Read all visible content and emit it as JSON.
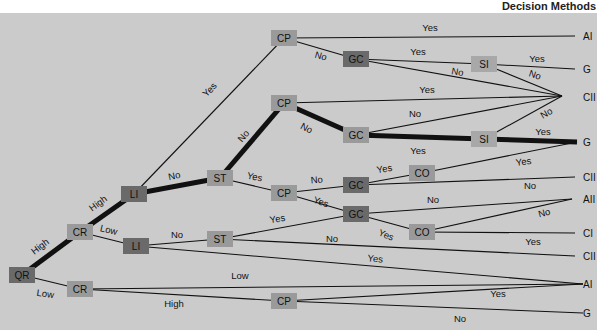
{
  "title": "Decision Methods",
  "colors": {
    "background": "#cbcbcb",
    "node_dark": "#6a6a6a",
    "node_medium": "#9a9a9a",
    "node_light": "#a8a8a8",
    "edge": "#111111"
  },
  "nodes": [
    {
      "id": "QR",
      "label": "QR",
      "x": 22,
      "y": 275,
      "shade": "dark"
    },
    {
      "id": "CR1",
      "label": "CR",
      "x": 80,
      "y": 232,
      "shade": "medium"
    },
    {
      "id": "CR2",
      "label": "CR",
      "x": 80,
      "y": 289,
      "shade": "medium"
    },
    {
      "id": "LI1",
      "label": "LI",
      "x": 134,
      "y": 194,
      "shade": "dark"
    },
    {
      "id": "LI2",
      "label": "LI",
      "x": 136,
      "y": 246,
      "shade": "dark"
    },
    {
      "id": "ST1",
      "label": "ST",
      "x": 220,
      "y": 178,
      "shade": "medium"
    },
    {
      "id": "ST2",
      "label": "ST",
      "x": 220,
      "y": 239,
      "shade": "medium"
    },
    {
      "id": "CP1",
      "label": "CP",
      "x": 284,
      "y": 38,
      "shade": "medium"
    },
    {
      "id": "CP2",
      "label": "CP",
      "x": 284,
      "y": 103,
      "shade": "medium"
    },
    {
      "id": "CP3",
      "label": "CP",
      "x": 284,
      "y": 193,
      "shade": "medium"
    },
    {
      "id": "CP4",
      "label": "CP",
      "x": 284,
      "y": 301,
      "shade": "medium"
    },
    {
      "id": "GC1",
      "label": "GC",
      "x": 356,
      "y": 59,
      "shade": "dark"
    },
    {
      "id": "GC2",
      "label": "GC",
      "x": 356,
      "y": 135,
      "shade": "medium"
    },
    {
      "id": "GC3",
      "label": "GC",
      "x": 356,
      "y": 185,
      "shade": "dark"
    },
    {
      "id": "GC4",
      "label": "GC",
      "x": 356,
      "y": 214,
      "shade": "dark"
    },
    {
      "id": "CO1",
      "label": "CO",
      "x": 422,
      "y": 173,
      "shade": "medium"
    },
    {
      "id": "CO2",
      "label": "CO",
      "x": 422,
      "y": 232,
      "shade": "medium"
    },
    {
      "id": "SI1",
      "label": "SI",
      "x": 484,
      "y": 64,
      "shade": "light"
    },
    {
      "id": "SI2",
      "label": "SI",
      "x": 484,
      "y": 139,
      "shade": "light"
    }
  ],
  "outcomes": [
    {
      "id": "o1",
      "label": "AI",
      "x": 583,
      "y": 36
    },
    {
      "id": "o2",
      "label": "G",
      "x": 583,
      "y": 69
    },
    {
      "id": "o3",
      "label": "CII",
      "x": 583,
      "y": 97
    },
    {
      "id": "o4",
      "label": "G",
      "x": 583,
      "y": 142
    },
    {
      "id": "o5",
      "label": "CII",
      "x": 583,
      "y": 177
    },
    {
      "id": "o6",
      "label": "AII",
      "x": 583,
      "y": 199
    },
    {
      "id": "o7",
      "label": "CI",
      "x": 583,
      "y": 233
    },
    {
      "id": "o8",
      "label": "CII",
      "x": 583,
      "y": 256
    },
    {
      "id": "o9",
      "label": "AI",
      "x": 583,
      "y": 284
    },
    {
      "id": "o10",
      "label": "G",
      "x": 583,
      "y": 313
    }
  ],
  "edges": [
    {
      "x1": 22,
      "y1": 275,
      "x2": 80,
      "y2": 232,
      "label": "High",
      "lx": 42,
      "ly": 249,
      "rot": -37,
      "thick": true
    },
    {
      "x1": 22,
      "y1": 275,
      "x2": 80,
      "y2": 289,
      "label": "Low",
      "lx": 45,
      "ly": 297,
      "rot": 8,
      "thick": false
    },
    {
      "x1": 80,
      "y1": 232,
      "x2": 134,
      "y2": 194,
      "label": "High",
      "lx": 100,
      "ly": 206,
      "rot": -36,
      "thick": true
    },
    {
      "x1": 80,
      "y1": 232,
      "x2": 136,
      "y2": 246,
      "label": "Low",
      "lx": 108,
      "ly": 233,
      "rot": 14,
      "thick": false
    },
    {
      "x1": 134,
      "y1": 194,
      "x2": 284,
      "y2": 38,
      "label": "Yes",
      "lx": 212,
      "ly": 92,
      "rot": -46,
      "thick": false
    },
    {
      "x1": 134,
      "y1": 194,
      "x2": 220,
      "y2": 178,
      "label": "No",
      "lx": 175,
      "ly": 179,
      "rot": -12,
      "thick": true
    },
    {
      "x1": 220,
      "y1": 178,
      "x2": 284,
      "y2": 103,
      "label": "No",
      "lx": 246,
      "ly": 138,
      "rot": -50,
      "thick": true
    },
    {
      "x1": 220,
      "y1": 178,
      "x2": 284,
      "y2": 193,
      "label": "Yes",
      "lx": 254,
      "ly": 180,
      "rot": 12,
      "thick": false
    },
    {
      "x1": 136,
      "y1": 246,
      "x2": 220,
      "y2": 239,
      "label": "No",
      "lx": 177,
      "ly": 238,
      "rot": 0,
      "thick": false
    },
    {
      "x1": 136,
      "y1": 246,
      "x2": 583,
      "y2": 284,
      "label": "Yes",
      "lx": 375,
      "ly": 262,
      "rot": 5,
      "thick": false
    },
    {
      "x1": 80,
      "y1": 289,
      "x2": 583,
      "y2": 284,
      "label": "Low",
      "lx": 240,
      "ly": 279,
      "rot": 0,
      "thick": false
    },
    {
      "x1": 80,
      "y1": 289,
      "x2": 284,
      "y2": 301,
      "label": "High",
      "lx": 174,
      "ly": 307,
      "rot": 0,
      "thick": false
    },
    {
      "x1": 284,
      "y1": 301,
      "x2": 583,
      "y2": 284,
      "label": "Yes",
      "lx": 498,
      "ly": 297,
      "rot": 0,
      "thick": false
    },
    {
      "x1": 284,
      "y1": 301,
      "x2": 583,
      "y2": 313,
      "label": "No",
      "lx": 460,
      "ly": 322,
      "rot": 0,
      "thick": false
    },
    {
      "x1": 284,
      "y1": 38,
      "x2": 575,
      "y2": 36,
      "label": "Yes",
      "lx": 430,
      "ly": 31,
      "rot": 0,
      "thick": false
    },
    {
      "x1": 284,
      "y1": 38,
      "x2": 356,
      "y2": 59,
      "label": "No",
      "lx": 320,
      "ly": 59,
      "rot": 15,
      "thick": false
    },
    {
      "x1": 356,
      "y1": 59,
      "x2": 484,
      "y2": 64,
      "label": "Yes",
      "lx": 418,
      "ly": 55,
      "rot": 0,
      "thick": false
    },
    {
      "x1": 356,
      "y1": 59,
      "x2": 562,
      "y2": 96,
      "label": "No",
      "lx": 457,
      "ly": 75,
      "rot": 10,
      "thick": false
    },
    {
      "x1": 484,
      "y1": 64,
      "x2": 575,
      "y2": 69,
      "label": "Yes",
      "lx": 537,
      "ly": 62,
      "rot": 0,
      "thick": false
    },
    {
      "x1": 484,
      "y1": 64,
      "x2": 562,
      "y2": 96,
      "label": "No",
      "lx": 534,
      "ly": 78,
      "rot": 18,
      "thick": false
    },
    {
      "x1": 284,
      "y1": 103,
      "x2": 562,
      "y2": 96,
      "label": "Yes",
      "lx": 427,
      "ly": 93,
      "rot": 0,
      "thick": false
    },
    {
      "x1": 284,
      "y1": 103,
      "x2": 356,
      "y2": 135,
      "label": "No",
      "lx": 305,
      "ly": 131,
      "rot": 28,
      "thick": true
    },
    {
      "x1": 356,
      "y1": 135,
      "x2": 562,
      "y2": 96,
      "label": "No",
      "lx": 415,
      "ly": 117,
      "rot": 0,
      "thick": false
    },
    {
      "x1": 356,
      "y1": 135,
      "x2": 484,
      "y2": 139,
      "label": "Yes",
      "lx": 418,
      "ly": 154,
      "rot": 0,
      "thick": true
    },
    {
      "x1": 484,
      "y1": 139,
      "x2": 562,
      "y2": 96,
      "label": "No",
      "lx": 548,
      "ly": 116,
      "rot": -30,
      "thick": false
    },
    {
      "x1": 484,
      "y1": 139,
      "x2": 577,
      "y2": 142,
      "label": "Yes",
      "lx": 543,
      "ly": 135,
      "rot": 0,
      "thick": true
    },
    {
      "x1": 284,
      "y1": 193,
      "x2": 356,
      "y2": 185,
      "label": "No",
      "lx": 317,
      "ly": 183,
      "rot": -5,
      "thick": false
    },
    {
      "x1": 284,
      "y1": 193,
      "x2": 356,
      "y2": 214,
      "label": "Yes",
      "lx": 320,
      "ly": 205,
      "rot": 18,
      "thick": false
    },
    {
      "x1": 356,
      "y1": 185,
      "x2": 422,
      "y2": 173,
      "label": "Yes",
      "lx": 385,
      "ly": 172,
      "rot": -10,
      "thick": false
    },
    {
      "x1": 356,
      "y1": 185,
      "x2": 575,
      "y2": 177,
      "label": "No",
      "lx": 530,
      "ly": 189,
      "rot": 0,
      "thick": false
    },
    {
      "x1": 422,
      "y1": 173,
      "x2": 577,
      "y2": 142,
      "label": "Yes",
      "lx": 524,
      "ly": 165,
      "rot": -8,
      "thick": false
    },
    {
      "x1": 220,
      "y1": 239,
      "x2": 356,
      "y2": 214,
      "label": "Yes",
      "lx": 278,
      "ly": 222,
      "rot": -10,
      "thick": false
    },
    {
      "x1": 220,
      "y1": 239,
      "x2": 575,
      "y2": 256,
      "label": "No",
      "lx": 332,
      "ly": 242,
      "rot": 0,
      "thick": false
    },
    {
      "x1": 356,
      "y1": 214,
      "x2": 572,
      "y2": 199,
      "label": "No",
      "lx": 433,
      "ly": 203,
      "rot": 0,
      "thick": false
    },
    {
      "x1": 356,
      "y1": 214,
      "x2": 422,
      "y2": 232,
      "label": "Yes",
      "lx": 385,
      "ly": 238,
      "rot": 22,
      "thick": false
    },
    {
      "x1": 422,
      "y1": 232,
      "x2": 572,
      "y2": 199,
      "label": "No",
      "lx": 545,
      "ly": 216,
      "rot": -15,
      "thick": false
    },
    {
      "x1": 422,
      "y1": 232,
      "x2": 575,
      "y2": 233,
      "label": "Yes",
      "lx": 533,
      "ly": 245,
      "rot": 0,
      "thick": false
    }
  ]
}
